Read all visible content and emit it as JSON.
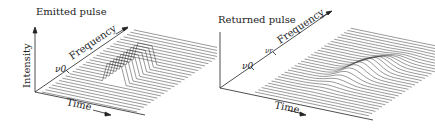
{
  "panels": [
    {
      "title": "Emitted pulse",
      "y_axis": "Intensity",
      "x_axis": "Time",
      "depth_axis": "Frequency",
      "marker": "ν0",
      "shape": "rectangular block"
    },
    {
      "title": "Returned pulse",
      "y_axis": "Intensity",
      "x_axis": "Time",
      "depth_axis": "Frequency",
      "marker": "ν0",
      "marker2": "νr",
      "shape": "smooth chirped hump"
    }
  ]
}
